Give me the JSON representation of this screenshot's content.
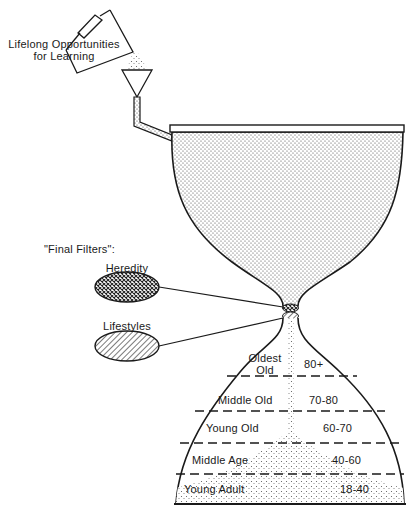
{
  "source_label": {
    "line1": "Lifelong Opportunities",
    "line2": "for Learning"
  },
  "filters": {
    "heading": "\"Final Filters\":",
    "items": [
      {
        "label": "Heredity",
        "pattern": "crosshatch"
      },
      {
        "label": "Lifestyles",
        "pattern": "diagonal-stripes"
      }
    ]
  },
  "age_bands": [
    {
      "name_line1": "Oldest",
      "name_line2": "Old",
      "range": "80+"
    },
    {
      "name_line1": "Middle Old",
      "name_line2": "",
      "range": "70-80"
    },
    {
      "name_line1": "Young Old",
      "name_line2": "",
      "range": "60-70"
    },
    {
      "name_line1": "Middle Age",
      "name_line2": "",
      "range": "40-60"
    },
    {
      "name_line1": "Young Adult",
      "name_line2": "",
      "range": "18-40"
    }
  ],
  "colors": {
    "ink": "#1a1a1a",
    "background": "#ffffff",
    "stipple": "#555555"
  }
}
